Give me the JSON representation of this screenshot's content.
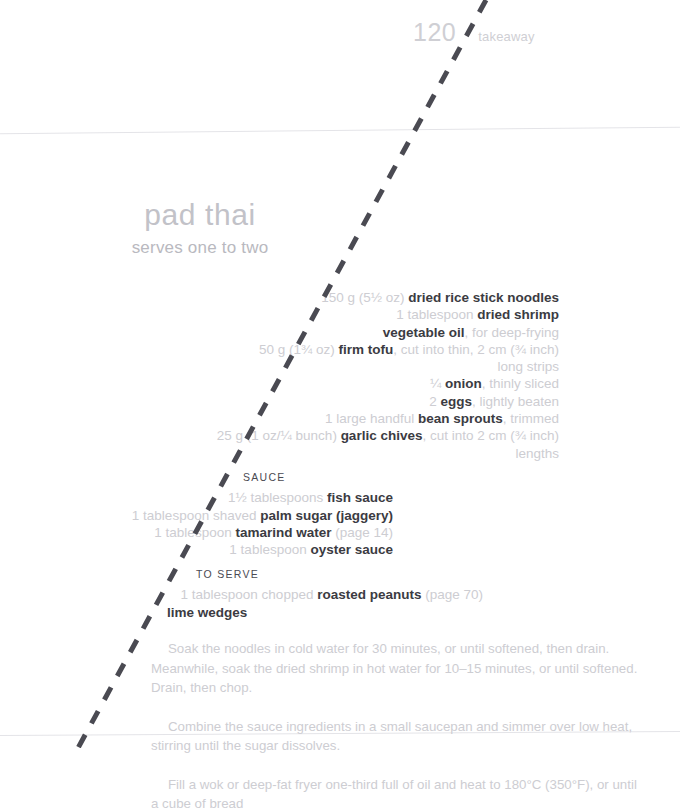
{
  "running_head": {
    "folio": "120",
    "section": "takeaway"
  },
  "recipe": {
    "title": "pad thai",
    "serves": "serves one to two",
    "ingredients": [
      {
        "quantity": "150 g (5½ oz) ",
        "name": "dried rice stick noodles",
        "prep": ""
      },
      {
        "quantity": "1 tablespoon ",
        "name": "dried shrimp",
        "prep": ""
      },
      {
        "quantity": "",
        "name": "vegetable oil",
        "prep": ", for deep-frying"
      },
      {
        "quantity": "50 g (1¾ oz) ",
        "name": "firm tofu",
        "prep": ", cut into thin, 2 cm (¾ inch)"
      },
      {
        "continuation": "long strips"
      },
      {
        "quantity": "¼ ",
        "name": "onion",
        "prep": ", thinly sliced"
      },
      {
        "quantity": "2 ",
        "name": "eggs",
        "prep": ", lightly beaten"
      },
      {
        "quantity": "1 large handful ",
        "name": "bean sprouts",
        "prep": ", trimmed"
      },
      {
        "quantity": "25 g (1 oz/¼ bunch) ",
        "name": "garlic chives",
        "prep": ", cut into 2 cm (¾ inch)"
      },
      {
        "continuation": "lengths"
      }
    ],
    "sauce": {
      "heading": "SAUCE",
      "items": [
        {
          "quantity": "1½ tablespoons ",
          "name": "fish sauce",
          "prep": ""
        },
        {
          "quantity": "1 tablespoon shaved ",
          "name": "palm sugar (jaggery)",
          "prep": ""
        },
        {
          "quantity": "1 tablespoon ",
          "name": "tamarind water",
          "prep": " (page 14)"
        },
        {
          "quantity": "1 tablespoon ",
          "name": "oyster sauce",
          "prep": ""
        }
      ]
    },
    "to_serve": {
      "heading": "TO SERVE",
      "items": [
        {
          "quantity": "1 tablespoon chopped ",
          "name": "roasted peanuts",
          "prep": " (page 70)"
        },
        {
          "quantity": "",
          "name": "lime wedges",
          "prep": ""
        }
      ]
    },
    "method": [
      "Soak the noodles in cold water for 30 minutes, or until softened, then drain. Meanwhile, soak the dried shrimp in hot water for 10–15 minutes, or until softened. Drain, then chop.",
      "Combine the sauce ingredients in a small saucepan and simmer over low heat, stirring until the sugar dissolves.",
      "Fill a wok or deep-fat fryer one-third full of oil and heat to 180°C (350°F), or until a cube of bread"
    ]
  },
  "annotation": {
    "type": "dashed-diagonal-line",
    "color": "#4a4a52",
    "start": {
      "x": 486,
      "y": 0
    },
    "end": {
      "x": 78,
      "y": 748
    }
  }
}
